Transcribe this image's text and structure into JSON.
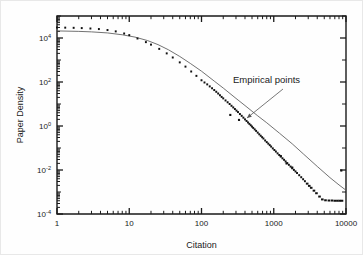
{
  "figure": {
    "background": "#ffffff",
    "ink_color": "#1a1a1a",
    "curve_color": "#585858"
  },
  "annotations": [
    {
      "name": "empirical-points",
      "text": "Empirical points",
      "text_x": 232,
      "text_y": 82,
      "leader_from_x": 282,
      "leader_from_y": 88,
      "leader_to_x": 246,
      "leader_to_y": 117
    }
  ],
  "chart_data": {
    "type": "scatter",
    "title": "",
    "xlabel": "Citation",
    "ylabel": "Paper Density",
    "xscale": "log",
    "yscale": "log",
    "xlim": [
      1,
      10000
    ],
    "ylim": [
      0.0001,
      100000
    ],
    "grid": false,
    "legend": null,
    "xticks": [
      1,
      10,
      100,
      1000,
      10000
    ],
    "xticklabels": [
      "1",
      "10",
      "100",
      "1000",
      "10000"
    ],
    "yticks": [
      0.0001,
      0.01,
      1,
      100,
      10000
    ],
    "yticklabels": [
      "10-4",
      "10-2",
      "100",
      "102",
      "104"
    ],
    "ytick_mantissa": "10",
    "ytick_exponents": [
      "-4",
      "-2",
      "0",
      "2",
      "4"
    ],
    "series": [
      {
        "name": "Empirical points",
        "marker": "square",
        "color": "#111111",
        "x": [
          1,
          1.3,
          1.7,
          2.2,
          2.9,
          3.8,
          5,
          6.5,
          8.5,
          10,
          13,
          17,
          20,
          26,
          33,
          40,
          50,
          60,
          72,
          85,
          100,
          110,
          120,
          130,
          140,
          150,
          160,
          170,
          180,
          190,
          200,
          215,
          230,
          245,
          260,
          275,
          290,
          305,
          320,
          340,
          360,
          380,
          400,
          420,
          440,
          460,
          480,
          500,
          520,
          545,
          570,
          600,
          630,
          660,
          690,
          720,
          760,
          800,
          840,
          880,
          920,
          970,
          1020,
          1070,
          1130,
          1190,
          1250,
          1320,
          1390,
          1460,
          1540,
          1620,
          1710,
          1800,
          1900,
          2000,
          2100,
          2250,
          2400,
          2550,
          2700,
          2900,
          3100,
          3300,
          3600,
          3900,
          4300,
          4700,
          5200,
          5800,
          6400,
          7000,
          7600,
          8200,
          8800
        ],
        "y": [
          30000,
          29500,
          29000,
          28200,
          27000,
          25500,
          23000,
          20000,
          16000,
          13500,
          9500,
          6500,
          5000,
          3200,
          2000,
          1300,
          780,
          500,
          300,
          190,
          120,
          95,
          78,
          63,
          52,
          43,
          36,
          30,
          25,
          21,
          18,
          14.5,
          12,
          10,
          8.3,
          7,
          5.9,
          5,
          4.3,
          3.5,
          2.9,
          2.4,
          2.0,
          1.7,
          1.45,
          1.25,
          1.08,
          0.94,
          0.82,
          0.7,
          0.6,
          0.5,
          0.42,
          0.36,
          0.31,
          0.27,
          0.22,
          0.185,
          0.158,
          0.135,
          0.116,
          0.096,
          0.081,
          0.069,
          0.057,
          0.048,
          0.041,
          0.034,
          0.029,
          0.0245,
          0.0205,
          0.0172,
          0.0143,
          0.012,
          0.0101,
          0.0086,
          0.0073,
          0.0058,
          0.0047,
          0.0038,
          0.0031,
          0.0024,
          0.0019,
          0.00155,
          0.00115,
          0.00088,
          0.00062,
          0.00046,
          0.00042,
          0.00041,
          0.00041,
          0.0004,
          0.0004,
          0.0004,
          0.0004
        ],
        "outliers_x": [
          250,
          330,
          1250,
          1500,
          1800,
          8600
        ],
        "outliers_y": [
          3.2,
          1.9,
          0.043,
          0.02,
          0.013,
          0.0095
        ]
      }
    ],
    "fit_curve": {
      "name": "model fit",
      "color": "#585858",
      "x": [
        1,
        2,
        3,
        5,
        8,
        12,
        18,
        25,
        35,
        50,
        70,
        100,
        150,
        200,
        300,
        400,
        600,
        800,
        1200,
        1800,
        2600,
        4000,
        6000,
        8000,
        10000
      ],
      "y": [
        21000,
        20000,
        19000,
        17000,
        14000,
        11000,
        7600,
        5000,
        2900,
        1450,
        700,
        310,
        110,
        53,
        18,
        8.5,
        2.9,
        1.4,
        0.47,
        0.155,
        0.052,
        0.0145,
        0.0045,
        0.0021,
        0.0012
      ]
    }
  }
}
